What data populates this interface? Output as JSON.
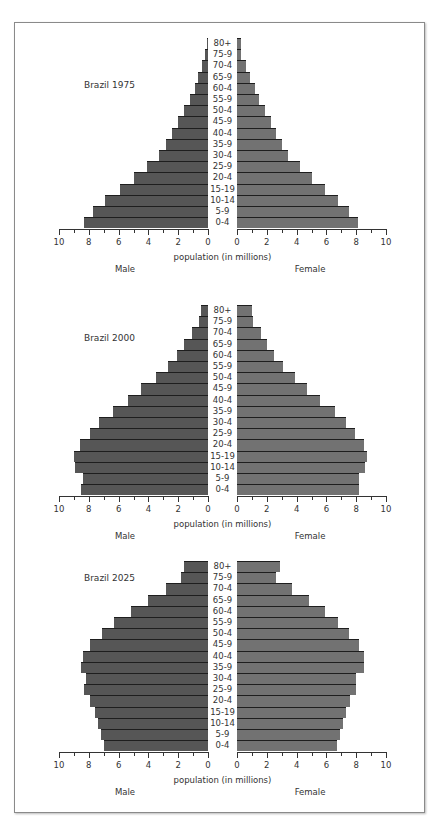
{
  "chart_data": [
    {
      "type": "bar",
      "orientation": "horizontal-pyramid",
      "title": "Brazil 1975",
      "categories": [
        "80+",
        "75-9",
        "70-4",
        "65-9",
        "60-4",
        "55-9",
        "50-4",
        "45-9",
        "40-4",
        "35-9",
        "30-4",
        "25-9",
        "20-4",
        "15-19",
        "10-14",
        "5-9",
        "0-4"
      ],
      "series": [
        {
          "name": "Male",
          "values": [
            0.1,
            0.2,
            0.4,
            0.7,
            0.9,
            1.2,
            1.6,
            2.0,
            2.4,
            2.8,
            3.3,
            4.1,
            5.0,
            5.9,
            6.9,
            7.7,
            8.3
          ]
        },
        {
          "name": "Female",
          "values": [
            0.3,
            0.3,
            0.6,
            0.9,
            1.2,
            1.5,
            1.9,
            2.3,
            2.6,
            3.0,
            3.4,
            4.2,
            5.0,
            5.9,
            6.8,
            7.5,
            8.1
          ]
        }
      ],
      "xlabel": "population (in millions)",
      "xlim": [
        0,
        10
      ],
      "xticks": [
        "10",
        "8",
        "6",
        "4",
        "2",
        "0"
      ],
      "xticks_right": [
        "0",
        "2",
        "4",
        "6",
        "8",
        "10"
      ],
      "side_labels": [
        "Male",
        "Female"
      ],
      "grid": false
    },
    {
      "type": "bar",
      "orientation": "horizontal-pyramid",
      "title": "Brazil 2000",
      "categories": [
        "80+",
        "75-9",
        "70-4",
        "65-9",
        "60-4",
        "55-9",
        "50-4",
        "45-9",
        "40-4",
        "35-9",
        "30-4",
        "25-9",
        "20-4",
        "15-19",
        "10-14",
        "5-9",
        "0-4"
      ],
      "series": [
        {
          "name": "Male",
          "values": [
            0.5,
            0.6,
            1.1,
            1.6,
            2.1,
            2.7,
            3.5,
            4.5,
            5.4,
            6.4,
            7.3,
            7.9,
            8.6,
            9.0,
            8.9,
            8.4,
            8.5
          ]
        },
        {
          "name": "Female",
          "values": [
            1.0,
            1.1,
            1.6,
            2.0,
            2.5,
            3.1,
            3.9,
            4.7,
            5.6,
            6.6,
            7.3,
            7.9,
            8.5,
            8.7,
            8.6,
            8.2,
            8.2
          ]
        }
      ],
      "xlabel": "population (in millions)",
      "xlim": [
        0,
        10
      ],
      "xticks": [
        "10",
        "8",
        "6",
        "4",
        "2",
        "0"
      ],
      "xticks_right": [
        "0",
        "2",
        "4",
        "6",
        "8",
        "10"
      ],
      "side_labels": [
        "Male",
        "Female"
      ],
      "grid": false
    },
    {
      "type": "bar",
      "orientation": "horizontal-pyramid",
      "title": "Brazil 2025",
      "categories": [
        "80+",
        "75-9",
        "70-4",
        "65-9",
        "60-4",
        "55-9",
        "50-4",
        "45-9",
        "40-4",
        "35-9",
        "30-4",
        "25-9",
        "20-4",
        "15-19",
        "10-14",
        "5-9",
        "0-4"
      ],
      "series": [
        {
          "name": "Male",
          "values": [
            1.6,
            1.8,
            2.8,
            4.0,
            5.2,
            6.3,
            7.1,
            7.9,
            8.4,
            8.5,
            8.2,
            8.3,
            7.9,
            7.6,
            7.4,
            7.2,
            7.0
          ]
        },
        {
          "name": "Female",
          "values": [
            2.9,
            2.6,
            3.7,
            4.8,
            5.9,
            6.8,
            7.5,
            8.2,
            8.5,
            8.5,
            8.0,
            8.0,
            7.6,
            7.3,
            7.1,
            6.9,
            6.7
          ]
        }
      ],
      "xlabel": "population (in millions)",
      "xlim": [
        0,
        10
      ],
      "xticks": [
        "10",
        "8",
        "6",
        "4",
        "2",
        "0"
      ],
      "xticks_right": [
        "0",
        "2",
        "4",
        "6",
        "8",
        "10"
      ],
      "side_labels": [
        "Male",
        "Female"
      ],
      "grid": false
    }
  ],
  "colors": {
    "male_bar": "#565656",
    "female_bar": "#727272",
    "bar_separator": "#1e1e1e",
    "frame": "#8a8a8a",
    "text": "#333333"
  },
  "layout": {
    "pyramids": [
      {
        "top_bar_y": 38,
        "axis_y": 229,
        "title_y": 80
      },
      {
        "top_bar_y": 305,
        "axis_y": 496,
        "title_y": 333
      },
      {
        "top_bar_y": 561,
        "axis_y": 752,
        "title_y": 573
      }
    ]
  }
}
